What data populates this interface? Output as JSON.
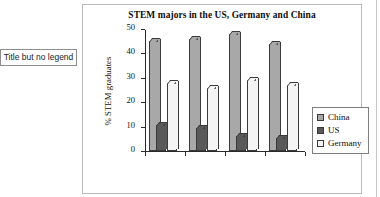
{
  "annotation": {
    "text": "Title but no legend"
  },
  "chart_data": {
    "type": "bar",
    "title": "STEM majors in the US, Germany and China",
    "xlabel": "",
    "ylabel": "% STEM graduates",
    "ylim": [
      0,
      50
    ],
    "yticks": [
      0,
      10,
      20,
      30,
      40,
      50
    ],
    "ytick_labels": [
      "0",
      "10",
      "20",
      "30",
      "40",
      "50"
    ],
    "categories": [
      "",
      "",
      "",
      ""
    ],
    "grid": false,
    "legend_position": "right",
    "series": [
      {
        "name": "China",
        "color": "#a8a8a8",
        "values": [
          45,
          46,
          48,
          44
        ]
      },
      {
        "name": "US",
        "color": "#595959",
        "values": [
          10.5,
          9.5,
          6,
          5.5
        ]
      },
      {
        "name": "Germany",
        "color": "#f4f4f4",
        "values": [
          28,
          26,
          29,
          27
        ]
      }
    ]
  },
  "legend": {
    "items": [
      {
        "label": "China"
      },
      {
        "label": "US"
      },
      {
        "label": "Germany"
      }
    ]
  }
}
